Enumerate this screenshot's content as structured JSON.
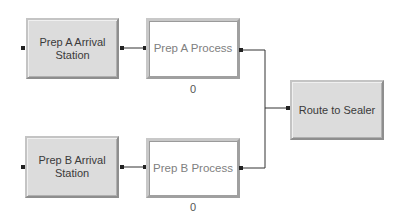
{
  "diagram": {
    "modules": [
      {
        "id": "prep_a_arrival",
        "label": "Prep A Arrival Station",
        "style": "shaded"
      },
      {
        "id": "prep_a_process",
        "label": "Prep A Process",
        "style": "white",
        "counter": "0"
      },
      {
        "id": "prep_b_arrival",
        "label": "Prep B Arrival Station",
        "style": "shaded"
      },
      {
        "id": "prep_b_process",
        "label": "Prep B Process",
        "style": "white",
        "counter": "0"
      },
      {
        "id": "route_to_sealer",
        "label": "Route to Sealer",
        "style": "shaded"
      }
    ],
    "connections": [
      {
        "from": "Prep A Arrival Station",
        "to": "Prep A Process"
      },
      {
        "from": "Prep A Process",
        "to": "Route to Sealer"
      },
      {
        "from": "Prep B Arrival Station",
        "to": "Prep B Process"
      },
      {
        "from": "Prep B Process",
        "to": "Route to Sealer"
      }
    ],
    "colors": {
      "shaded_fill": "#dcdcdc",
      "white_fill": "#ffffff",
      "wire": "#333333"
    }
  }
}
